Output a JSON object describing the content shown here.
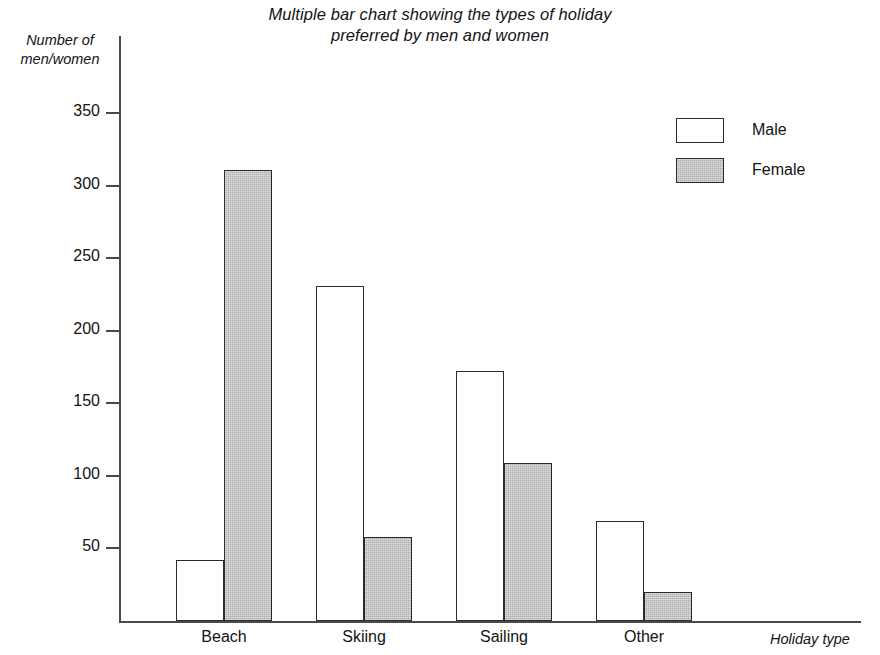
{
  "chart_data": {
    "type": "bar",
    "title": "Multiple bar chart showing the types of holiday\npreferred by men and women",
    "xlabel": "Holiday type",
    "ylabel": "Number of\nmen/women",
    "categories": [
      "Beach",
      "Skiing",
      "Sailing",
      "Other"
    ],
    "series": [
      {
        "name": "Male",
        "values": [
          42,
          231,
          172,
          69
        ],
        "color": "#ffffff"
      },
      {
        "name": "Female",
        "values": [
          311,
          58,
          109,
          20
        ],
        "color": "#bcbcbc"
      }
    ],
    "ylim": [
      0,
      370
    ],
    "yticks": [
      50,
      100,
      150,
      200,
      250,
      300,
      350
    ],
    "ytick_labels": [
      "50",
      "100",
      "150",
      "200",
      "250",
      "300",
      "350"
    ],
    "grid": false,
    "legend_position": "top-right",
    "axis_color": "#4a4a4a",
    "bar_outline_color": "#2b2b2b"
  },
  "legend": {
    "entries": [
      {
        "label": "Male"
      },
      {
        "label": "Female"
      }
    ]
  }
}
